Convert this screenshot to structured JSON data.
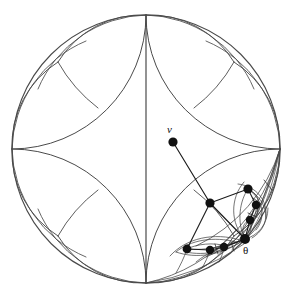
{
  "figure": {
    "type": "hyperbolic-tiling-diagram"
  },
  "labels": {
    "vertex_v": "v",
    "angle_theta": "θ"
  },
  "colors": {
    "background": "#ffffff",
    "stroke": "#4a4a4a",
    "stroke_dark": "#2b2b2b",
    "node_fill": "#111111",
    "text": "#111111"
  },
  "disk": {
    "center_x": 146,
    "center_y": 149,
    "radius": 134,
    "stroke_width": 1.1
  },
  "ideal_vertices": [
    {
      "name": "top",
      "x": 146,
      "y": 15
    },
    {
      "name": "right",
      "x": 280,
      "y": 149
    },
    {
      "name": "bottom",
      "x": 146,
      "y": 283
    },
    {
      "name": "left",
      "x": 12,
      "y": 149
    }
  ],
  "nodes": [
    {
      "name": "node-v",
      "x": 173,
      "y": 142,
      "r": 4.6
    },
    {
      "name": "node-mid",
      "x": 210,
      "y": 203,
      "r": 4.6
    },
    {
      "name": "node-theta",
      "x": 245,
      "y": 239,
      "r": 5.0
    },
    {
      "name": "node-right-1",
      "x": 248,
      "y": 189,
      "r": 4.6
    },
    {
      "name": "node-right-2",
      "x": 256,
      "y": 205,
      "r": 4.2
    },
    {
      "name": "node-right-3",
      "x": 250,
      "y": 220,
      "r": 4.2
    },
    {
      "name": "node-bot-1",
      "x": 187,
      "y": 249,
      "r": 4.4
    },
    {
      "name": "node-bot-2",
      "x": 210,
      "y": 250,
      "r": 4.2
    },
    {
      "name": "node-bot-3",
      "x": 224,
      "y": 247,
      "r": 4.2
    }
  ],
  "geodesic_path": {
    "name": "ray-from-v-to-theta",
    "points": [
      [
        173,
        142
      ],
      [
        210,
        203
      ],
      [
        245,
        239
      ]
    ]
  },
  "node_chains": {
    "right_chain": [
      [
        245,
        239
      ],
      [
        250,
        220
      ],
      [
        256,
        205
      ],
      [
        248,
        189
      ]
    ],
    "bottom_chain": [
      [
        245,
        239
      ],
      [
        224,
        247
      ],
      [
        210,
        250
      ],
      [
        187,
        249
      ]
    ]
  },
  "stroke_widths": {
    "boundary": 1.1,
    "arc": 1.0,
    "fine_arc": 0.75,
    "path": 1.15
  }
}
